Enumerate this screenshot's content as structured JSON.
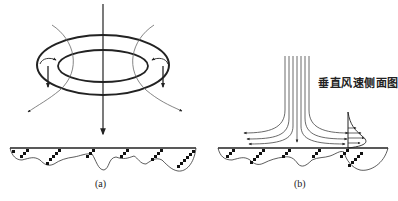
{
  "panels": [
    {
      "id": "a",
      "caption": "(a)",
      "description": "Microburst vortex ring descending toward ground"
    },
    {
      "id": "b",
      "caption": "(b)",
      "description": "Downdraft spreading horizontally at ground with vertical wind profile",
      "annotation": "垂直风速侧面图"
    }
  ],
  "colors": {
    "line": "#222222",
    "thin_line": "#555555",
    "background": "#ffffff"
  }
}
